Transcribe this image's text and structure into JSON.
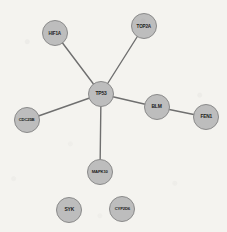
{
  "figure": {
    "kind": "protein-interaction-network",
    "width": 227,
    "height": 232,
    "background_color": "#f4f3ef",
    "node_fill_color": "#bdbdbd",
    "node_border_color": "#8a8a8a",
    "node_label_color": "#1c1c1c",
    "edge_color": "#6f6f6f",
    "edge_width": 1.4,
    "node_radius": 13
  },
  "nodes": [
    {
      "id": "TP53",
      "label": "TP53",
      "x": 101,
      "y": 94,
      "r": 13,
      "font_size": 5.4,
      "degree": 5
    },
    {
      "id": "HIF1A",
      "label": "HIF1A",
      "x": 55,
      "y": 33,
      "r": 13,
      "font_size": 5.0,
      "degree": 1
    },
    {
      "id": "TOP2A",
      "label": "TOP2A",
      "x": 144,
      "y": 26,
      "r": 13,
      "font_size": 5.0,
      "degree": 1
    },
    {
      "id": "CDC25B",
      "label": "CDC25B",
      "x": 27,
      "y": 120,
      "r": 13,
      "font_size": 4.6,
      "degree": 1
    },
    {
      "id": "BLM",
      "label": "BLM",
      "x": 157,
      "y": 107,
      "r": 13,
      "font_size": 5.4,
      "degree": 2
    },
    {
      "id": "FEN1",
      "label": "FEN1",
      "x": 206,
      "y": 117,
      "r": 13,
      "font_size": 5.2,
      "degree": 1
    },
    {
      "id": "MAPK10",
      "label": "MAPK10",
      "x": 100,
      "y": 172,
      "r": 13,
      "font_size": 4.6,
      "degree": 1
    },
    {
      "id": "SYK",
      "label": "SYK",
      "x": 69,
      "y": 210,
      "r": 13,
      "font_size": 5.4,
      "degree": 0
    },
    {
      "id": "CYP2D6",
      "label": "CYP2D6",
      "x": 122,
      "y": 209,
      "r": 13,
      "font_size": 4.6,
      "degree": 0
    }
  ],
  "edges": [
    {
      "source": "TP53",
      "target": "HIF1A",
      "x1": 101,
      "y1": 94,
      "x2": 55,
      "y2": 33
    },
    {
      "source": "TP53",
      "target": "TOP2A",
      "x1": 101,
      "y1": 94,
      "x2": 144,
      "y2": 26
    },
    {
      "source": "TP53",
      "target": "CDC25B",
      "x1": 101,
      "y1": 94,
      "x2": 27,
      "y2": 120
    },
    {
      "source": "TP53",
      "target": "BLM",
      "x1": 101,
      "y1": 94,
      "x2": 157,
      "y2": 107
    },
    {
      "source": "TP53",
      "target": "MAPK10",
      "x1": 101,
      "y1": 94,
      "x2": 100,
      "y2": 172
    },
    {
      "source": "BLM",
      "target": "FEN1",
      "x1": 157,
      "y1": 107,
      "x2": 206,
      "y2": 117
    }
  ]
}
